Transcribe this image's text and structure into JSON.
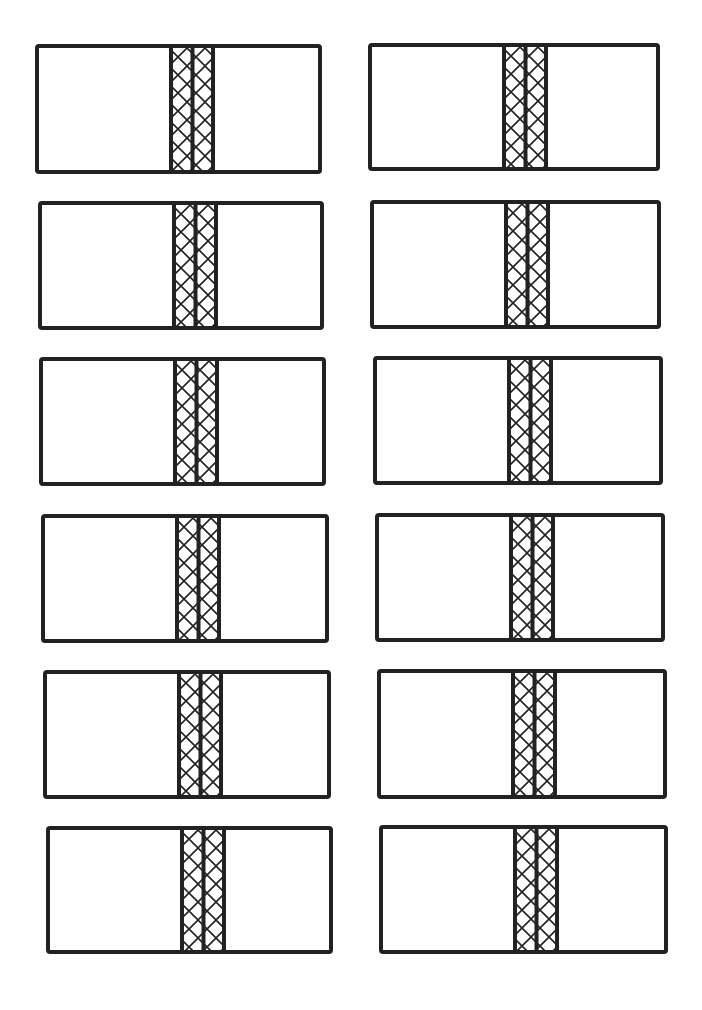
{
  "diagram": {
    "title": "",
    "stroke_color": "#222222",
    "background": "#ffffff",
    "layout": {
      "columns": 2,
      "rows": 6
    },
    "cards": [
      {
        "x": 35,
        "y": 44,
        "w": 287,
        "h": 130,
        "band_x": 130
      },
      {
        "x": 368,
        "y": 43,
        "w": 292,
        "h": 128,
        "band_x": 130
      },
      {
        "x": 38,
        "y": 201,
        "w": 286,
        "h": 129,
        "band_x": 130
      },
      {
        "x": 370,
        "y": 200,
        "w": 291,
        "h": 129,
        "band_x": 130
      },
      {
        "x": 39,
        "y": 357,
        "w": 287,
        "h": 129,
        "band_x": 130
      },
      {
        "x": 373,
        "y": 356,
        "w": 290,
        "h": 129,
        "band_x": 130
      },
      {
        "x": 41,
        "y": 514,
        "w": 288,
        "h": 129,
        "band_x": 130
      },
      {
        "x": 375,
        "y": 513,
        "w": 290,
        "h": 129,
        "band_x": 130
      },
      {
        "x": 43,
        "y": 670,
        "w": 288,
        "h": 129,
        "band_x": 130
      },
      {
        "x": 377,
        "y": 669,
        "w": 290,
        "h": 130,
        "band_x": 130
      },
      {
        "x": 46,
        "y": 826,
        "w": 287,
        "h": 128,
        "band_x": 130
      },
      {
        "x": 379,
        "y": 825,
        "w": 289,
        "h": 129,
        "band_x": 130
      }
    ]
  }
}
